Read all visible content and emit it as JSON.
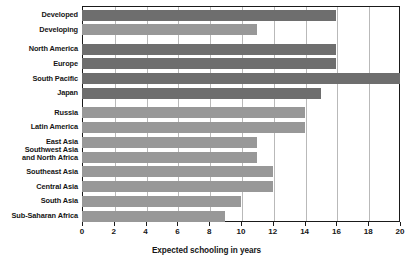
{
  "chart_data": {
    "type": "bar",
    "orientation": "horizontal",
    "title": "",
    "xlabel": "Expected schooling in years",
    "ylabel": "",
    "xlim": [
      0,
      20
    ],
    "xticks": [
      0,
      2,
      4,
      6,
      8,
      10,
      12,
      14,
      16,
      18,
      20
    ],
    "xtick_labels": [
      "0",
      "2",
      "4",
      "6",
      "8",
      "10",
      "12",
      "14",
      "16",
      "18",
      "20"
    ],
    "grid": "vertical",
    "legend": "none",
    "categories": [
      "Developed",
      "Developing",
      "North America",
      "Europe",
      "South Pacific",
      "Japan",
      "Russia",
      "Latin America",
      "East Asia",
      "Southwest Asia\nand North Africa",
      "Southeast Asia",
      "Central Asia",
      "South Asia",
      "Sub-Saharan Africa"
    ],
    "values": [
      16,
      11,
      16,
      16,
      20,
      15,
      14,
      14,
      11,
      11,
      12,
      12,
      10,
      9
    ],
    "groups": [
      {
        "name": "summary",
        "indices": [
          0,
          1
        ]
      },
      {
        "name": "high-income-regions",
        "indices": [
          2,
          3,
          4,
          5
        ]
      },
      {
        "name": "other-regions",
        "indices": [
          6,
          7,
          8,
          9,
          10,
          11,
          12,
          13
        ]
      }
    ],
    "bar_shades": [
      "dark",
      "light",
      "dark",
      "dark",
      "dark",
      "dark",
      "light",
      "light",
      "light",
      "light",
      "light",
      "light",
      "light",
      "light"
    ],
    "colors": {
      "bar_dark": "#6e6e6e",
      "bar_light": "#989898",
      "gridline": "#b9b9b9",
      "axis": "#1a1a1a",
      "background": "#ffffff",
      "text": "#161616"
    }
  }
}
